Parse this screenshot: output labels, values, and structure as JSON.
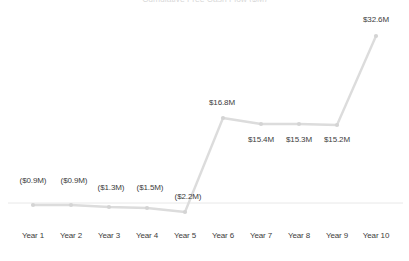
{
  "chart_data": {
    "type": "line",
    "title": "",
    "xlabel": "",
    "ylabel": "",
    "grid": false,
    "legend": false,
    "zero_line": true,
    "units": "$M",
    "categories": [
      "Year 1",
      "Year 2",
      "Year 3",
      "Year 4",
      "Year 5",
      "Year 6",
      "Year 7",
      "Year 8",
      "Year 9",
      "Year 10"
    ],
    "values": [
      -0.9,
      -0.9,
      -1.3,
      -1.5,
      -2.2,
      16.8,
      15.4,
      15.3,
      15.2,
      32.6
    ],
    "data_labels": [
      "($0.9M)",
      "($0.9M)",
      "($1.3M)",
      "($1.5M)",
      "($2.2M)",
      "$16.8M",
      "$15.4M",
      "$15.3M",
      "$15.2M",
      "$32.6M"
    ],
    "label_positions": [
      "above",
      "above",
      "above",
      "above",
      "above",
      "above",
      "below",
      "below",
      "below",
      "above"
    ],
    "ylim": [
      -4.0,
      35.5
    ],
    "colors": {
      "line": "#dcdcdc",
      "marker": "#d4d4d4",
      "axis": "#e8e8e8",
      "text": "#3d3d3d"
    }
  },
  "axis": {
    "ticks": [
      {
        "label": "Year 1"
      },
      {
        "label": "Year 2"
      },
      {
        "label": "Year 3"
      },
      {
        "label": "Year 4"
      },
      {
        "label": "Year 5"
      },
      {
        "label": "Year 6"
      },
      {
        "label": "Year 7"
      },
      {
        "label": "Year 8"
      },
      {
        "label": "Year 9"
      },
      {
        "label": "Year 10"
      }
    ]
  },
  "points": [
    {
      "label": "($0.9M)",
      "x": 33,
      "y": 205,
      "lx": 33,
      "ly": 176
    },
    {
      "label": "($0.9M)",
      "x": 71,
      "y": 205,
      "lx": 74,
      "ly": 176
    },
    {
      "label": "($1.3M)",
      "x": 109,
      "y": 207,
      "lx": 111,
      "ly": 183
    },
    {
      "label": "($1.5M)",
      "x": 147,
      "y": 208,
      "lx": 150,
      "ly": 183
    },
    {
      "label": "($2.2M)",
      "x": 185,
      "y": 212,
      "lx": 188,
      "ly": 192
    },
    {
      "label": "$16.8M",
      "x": 223,
      "y": 118,
      "lx": 222,
      "ly": 98
    },
    {
      "label": "$15.4M",
      "x": 261,
      "y": 124,
      "lx": 261,
      "ly": 135
    },
    {
      "label": "$15.3M",
      "x": 299,
      "y": 124,
      "lx": 299,
      "ly": 135
    },
    {
      "label": "$15.2M",
      "x": 337,
      "y": 125,
      "lx": 337,
      "ly": 135
    },
    {
      "label": "$32.6M",
      "x": 376,
      "y": 36,
      "lx": 376,
      "ly": 15
    }
  ],
  "zero_line": {
    "y": 203,
    "x1": 8,
    "x2": 403
  },
  "title_fragment": {
    "text": "Cumulative Free Cash Flow ($M)"
  }
}
